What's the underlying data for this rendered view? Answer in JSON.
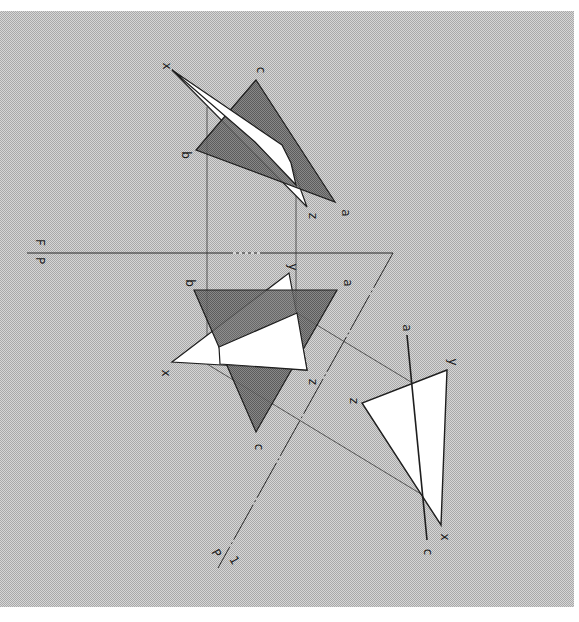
{
  "colors": {
    "page_bg": "#ffffff",
    "halftone_a": "#b9b9b9",
    "halftone_b": "#d6d6d6",
    "shaded_triangle": "#6e6e6e",
    "white_triangle": "#ffffff",
    "line": "#1e1e1e",
    "thin_line": "#333333"
  },
  "frame": {
    "x": 0,
    "y": 11,
    "width": 574,
    "height": 596
  },
  "folding_line": {
    "label_top": "F",
    "label_bottom": "P",
    "x1": 27,
    "y1": 253,
    "x2": 393,
    "y2": 253
  },
  "auxiliary_plane": {
    "label_left": "P",
    "label_right": "1",
    "x1": 393,
    "y1": 253,
    "x2": 218,
    "y2": 568
  },
  "top_view": {
    "triangle_abc": {
      "points": "256,80 196,150 335,202",
      "labels": [
        {
          "text": "c",
          "x": 257,
          "y": 70
        },
        {
          "text": "b",
          "x": 182,
          "y": 155
        },
        {
          "text": "a",
          "x": 342,
          "y": 213
        }
      ]
    },
    "triangle_xyz": {
      "points": "172,70 291,163 307,207",
      "labels": [
        {
          "text": "x",
          "x": 163,
          "y": 66
        },
        {
          "text": "z",
          "x": 309,
          "y": 216
        }
      ]
    }
  },
  "front_view": {
    "triangle_abc": {
      "points": "194,290 337,290 256,432",
      "labels": [
        {
          "text": "b",
          "x": 186,
          "y": 283
        },
        {
          "text": "a",
          "x": 344,
          "y": 283
        },
        {
          "text": "c",
          "x": 255,
          "y": 447
        }
      ]
    },
    "triangle_xyz": {
      "points": "172,362 289,273 307,370",
      "labels": [
        {
          "text": "x",
          "x": 162,
          "y": 373
        },
        {
          "text": "y",
          "x": 289,
          "y": 267
        },
        {
          "text": "z",
          "x": 309,
          "y": 382
        }
      ]
    },
    "visible_white_band": "219,347 297,313 307,370 220,364"
  },
  "auxiliary_view": {
    "edge_ac": {
      "x1": 407,
      "y1": 335,
      "x2": 427,
      "y2": 540,
      "labels": [
        {
          "text": "a",
          "x": 403,
          "y": 328
        },
        {
          "text": "c",
          "x": 424,
          "y": 552
        }
      ]
    },
    "triangle_xyz": {
      "points": "447,370 362,403 441,525",
      "labels": [
        {
          "text": "y",
          "x": 449,
          "y": 362
        },
        {
          "text": "z",
          "x": 350,
          "y": 401
        },
        {
          "text": "x",
          "x": 441,
          "y": 537
        }
      ]
    }
  },
  "projection_lines": [
    {
      "x1": 207,
      "y1": 107,
      "x2": 207,
      "y2": 364
    },
    {
      "x1": 296,
      "y1": 170,
      "x2": 296,
      "y2": 313
    },
    {
      "x1": 297,
      "y1": 313,
      "x2": 411,
      "y2": 382
    },
    {
      "x1": 207,
      "y1": 364,
      "x2": 421,
      "y2": 494
    }
  ]
}
